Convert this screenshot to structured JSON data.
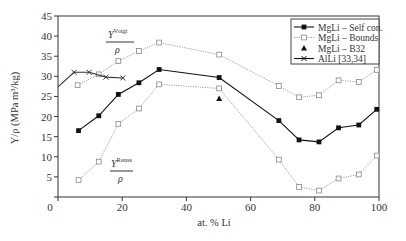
{
  "chart_data": {
    "type": "line",
    "title": "",
    "xlabel": "at. % Li",
    "ylabel": "Y/ρ (MPa m³/kg)",
    "xlim": [
      0,
      100
    ],
    "ylim": [
      0,
      45
    ],
    "xticks": [
      0,
      20,
      40,
      60,
      80,
      100
    ],
    "yticks": [
      5,
      10,
      15,
      20,
      25,
      30,
      35,
      40,
      45
    ],
    "xtick_labels": [
      "0",
      "20",
      "40",
      "60",
      "80",
      "100"
    ],
    "ytick_labels": [
      "5",
      "10",
      "15",
      "20",
      "25",
      "30",
      "35",
      "40",
      "45"
    ],
    "grid": false,
    "legend_position": "upper right",
    "series": [
      {
        "name": "MgLi – Self con.",
        "style": "solid",
        "marker": "filled-square",
        "color": "#111111",
        "x": [
          6.4,
          12.7,
          18.8,
          25.2,
          31.5,
          50.2,
          68.8,
          75.1,
          81.3,
          87.4,
          93.7,
          99.3
        ],
        "y": [
          16.5,
          20.2,
          25.5,
          28.4,
          31.7,
          29.7,
          19.0,
          14.2,
          13.7,
          17.2,
          17.9,
          21.8
        ]
      },
      {
        "name": "MgLi – Bounds",
        "style": "dotted",
        "marker": "open-square",
        "color": "#888888",
        "x": [
          6.1,
          12.7,
          18.8,
          25.2,
          31.5,
          50.2,
          68.8,
          75.1,
          81.3,
          87.4,
          93.7,
          99.3
        ],
        "y": [
          27.8,
          30.5,
          33.8,
          36.3,
          38.4,
          35.4,
          27.6,
          24.8,
          25.3,
          29.0,
          28.6,
          31.6
        ],
        "bound": "Voigt"
      },
      {
        "name": "MgLi – Bounds (Reuss)",
        "style": "dotted",
        "marker": "open-square",
        "color": "#888888",
        "x": [
          6.4,
          12.7,
          18.8,
          25.2,
          31.5,
          50.2,
          68.8,
          75.1,
          81.3,
          87.4,
          93.7,
          99.3
        ],
        "y": [
          4.2,
          8.8,
          18.2,
          22.0,
          28.0,
          27.0,
          9.3,
          2.5,
          1.6,
          4.6,
          5.6,
          10.3
        ],
        "bound": "Reuss"
      },
      {
        "name": "MgLi – B32",
        "style": "none",
        "marker": "filled-triangle",
        "color": "#111111",
        "x": [
          50.2
        ],
        "y": [
          24.5
        ]
      },
      {
        "name": "AlLi [33,34]",
        "style": "solid",
        "marker": "x",
        "color": "#333333",
        "x": [
          0,
          5.0,
          9.7,
          14.9,
          20.2
        ],
        "y": [
          27.4,
          31.0,
          31.0,
          29.8,
          29.6
        ]
      }
    ],
    "annotations": [
      {
        "text": "Y",
        "sup": "Voigt",
        "denominator": "ρ",
        "x": 17,
        "y": 39.5
      },
      {
        "text": "Y",
        "sup": "Reuss",
        "denominator": "ρ",
        "x": 20,
        "y": 8
      }
    ]
  },
  "legend": {
    "items": [
      {
        "label": "MgLi – Self con.",
        "marker": "filled-square",
        "line": "solid"
      },
      {
        "label": "MgLi – Bounds",
        "marker": "open-square",
        "line": "dotted"
      },
      {
        "label": "MgLi – B32",
        "marker": "filled-triangle",
        "line": "none"
      },
      {
        "label": "AlLi [33,34]",
        "marker": "x",
        "line": "solid"
      }
    ]
  }
}
